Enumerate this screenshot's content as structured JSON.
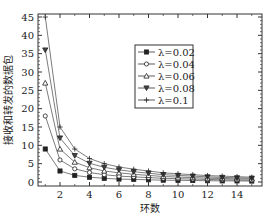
{
  "chart_data": {
    "type": "line",
    "title": "",
    "xlabel": "环数",
    "ylabel": "接收和转发的数据包",
    "x": [
      1,
      2,
      3,
      4,
      5,
      6,
      7,
      8,
      9,
      10,
      11,
      12,
      13,
      14,
      15
    ],
    "xlim": [
      0.3,
      15.5
    ],
    "ylim": [
      -1,
      46
    ],
    "xticks": [
      2,
      4,
      6,
      8,
      10,
      12,
      14
    ],
    "yticks": [
      0,
      5,
      10,
      15,
      20,
      25,
      30,
      35,
      40,
      45
    ],
    "grid": false,
    "legend_position": "upper right (inside)",
    "series": [
      {
        "name": "λ=0.02",
        "marker": "square",
        "values": [
          9,
          3,
          1.8,
          1.3,
          1.0,
          0.8,
          0.7,
          0.6,
          0.5,
          0.45,
          0.4,
          0.35,
          0.3,
          0.3,
          0.25
        ]
      },
      {
        "name": "λ=0.04",
        "marker": "circle",
        "values": [
          18,
          6,
          3.6,
          2.6,
          2.0,
          1.6,
          1.4,
          1.2,
          1.0,
          0.9,
          0.8,
          0.7,
          0.6,
          0.55,
          0.5
        ]
      },
      {
        "name": "λ=0.06",
        "marker": "triangle-up",
        "values": [
          27,
          9,
          5.4,
          3.9,
          3.0,
          2.5,
          2.1,
          1.8,
          1.5,
          1.35,
          1.2,
          1.05,
          0.95,
          0.85,
          0.8
        ]
      },
      {
        "name": "λ=0.08",
        "marker": "triangle-down",
        "values": [
          36,
          12,
          7.2,
          5.1,
          4.0,
          3.3,
          2.8,
          2.4,
          2.0,
          1.8,
          1.6,
          1.4,
          1.25,
          1.15,
          1.05
        ]
      },
      {
        "name": "λ=0.1",
        "marker": "plus",
        "values": [
          45,
          15,
          9.0,
          6.4,
          5.0,
          4.1,
          3.5,
          3.0,
          2.5,
          2.25,
          2.0,
          1.75,
          1.6,
          1.45,
          1.3
        ]
      }
    ]
  }
}
